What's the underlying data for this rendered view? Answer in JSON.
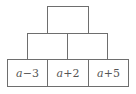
{
  "diagram": {
    "type": "number-pyramid",
    "line_color": "#6e6e6e",
    "text_color": "#555555",
    "rows": [
      {
        "row": "top",
        "cells": [
          {
            "label": ""
          }
        ]
      },
      {
        "row": "middle",
        "cells": [
          {
            "label": ""
          },
          {
            "label": ""
          }
        ]
      },
      {
        "row": "bottom",
        "cells": [
          {
            "label": "a−3",
            "var": "a",
            "rest": "−3"
          },
          {
            "label": "a+2",
            "var": "a",
            "rest": "+2"
          },
          {
            "label": "a+5",
            "var": "a",
            "rest": "+5"
          }
        ]
      }
    ]
  }
}
